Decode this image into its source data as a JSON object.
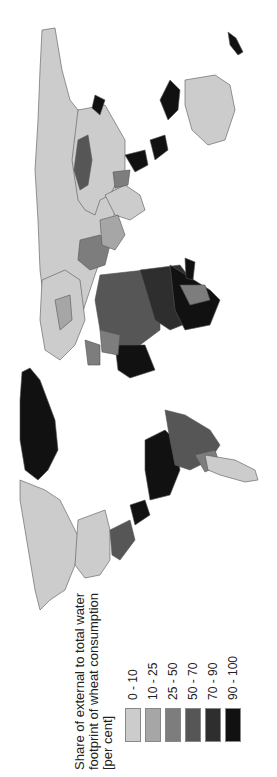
{
  "map": {
    "orientation": "rotated-90-ccw",
    "subject": "World map of share of external to total water footprint of wheat consumption",
    "ocean_color": "#ffffff",
    "border_color": "#555555"
  },
  "legend": {
    "title_lines": [
      "Share of external to total water",
      "footprint of wheat consumption",
      "[per cent]"
    ],
    "classes": [
      {
        "label": "0 - 10",
        "color": "#cccccc"
      },
      {
        "label": "10 - 25",
        "color": "#a6a6a6"
      },
      {
        "label": "25 - 50",
        "color": "#7d7d7d"
      },
      {
        "label": "50 - 70",
        "color": "#565656"
      },
      {
        "label": "70 - 90",
        "color": "#2e2e2e"
      },
      {
        "label": "90 - 100",
        "color": "#111111"
      }
    ]
  }
}
